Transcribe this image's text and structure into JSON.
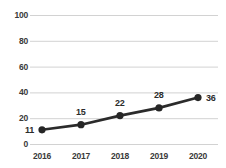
{
  "chart_data": {
    "type": "line",
    "title": "",
    "subtitle": "",
    "xlabel": "",
    "ylabel": "",
    "categories": [
      "2016",
      "2017",
      "2018",
      "2019",
      "2020"
    ],
    "values": [
      11,
      15,
      22,
      28,
      36
    ],
    "point_labels": [
      "11",
      "15",
      "22",
      "28",
      "36"
    ],
    "ylim": [
      0,
      100
    ],
    "ytick_labels": [
      "0",
      "20",
      "40",
      "60",
      "80",
      "100"
    ],
    "ytick_values": [
      0,
      20,
      40,
      60,
      80,
      100
    ],
    "grid": true,
    "grid_axis": "y",
    "legend": false,
    "legend_position": "none",
    "series": [
      {
        "name": "",
        "values": [
          11,
          15,
          22,
          28,
          36
        ]
      }
    ],
    "colors": {
      "line": "#2b2b2b",
      "marker": "#262626",
      "grid": "#d2d2d2",
      "axis_text": "#3a3a3a",
      "label_text": "#2b2b2b",
      "background": "#ffffff"
    }
  }
}
